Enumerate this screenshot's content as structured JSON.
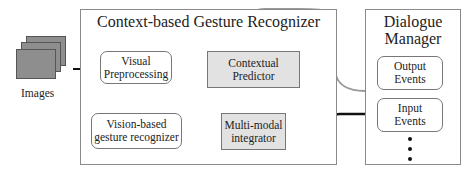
{
  "diagram": {
    "input": {
      "label": "Images"
    },
    "recognizer_panel": {
      "title": "Context-based Gesture Recognizer",
      "nodes": {
        "visual_preprocessing": [
          "Visual",
          "Preprocessing"
        ],
        "vision_gesture": [
          "Vision-based",
          "gesture recognizer"
        ],
        "contextual_predictor": [
          "Contextual",
          "Predictor"
        ],
        "multimodal_integrator": [
          "Multi-modal",
          "integrator"
        ]
      }
    },
    "dialogue_panel": {
      "title": [
        "Dialogue",
        "Manager"
      ],
      "nodes": {
        "output_events": [
          "Output",
          "Events"
        ],
        "input_events": [
          "Input",
          "Events"
        ]
      },
      "more_indicator": "vertical-ellipsis"
    },
    "edges": [
      {
        "from": "Images",
        "to": "Visual Preprocessing",
        "color": "#111111"
      },
      {
        "from": "Visual Preprocessing",
        "to": "Vision-based gesture recognizer",
        "color": "#111111"
      },
      {
        "from": "Vision-based gesture recognizer",
        "to": "Multi-modal integrator",
        "color": "#111111"
      },
      {
        "from": "Contextual Predictor",
        "to": "Multi-modal integrator",
        "color": "#999999"
      },
      {
        "from": "Multi-modal integrator",
        "to": "Input Events",
        "color": "#111111"
      },
      {
        "from": "Output Events",
        "to": "Contextual Predictor",
        "color": "#999999"
      }
    ]
  }
}
